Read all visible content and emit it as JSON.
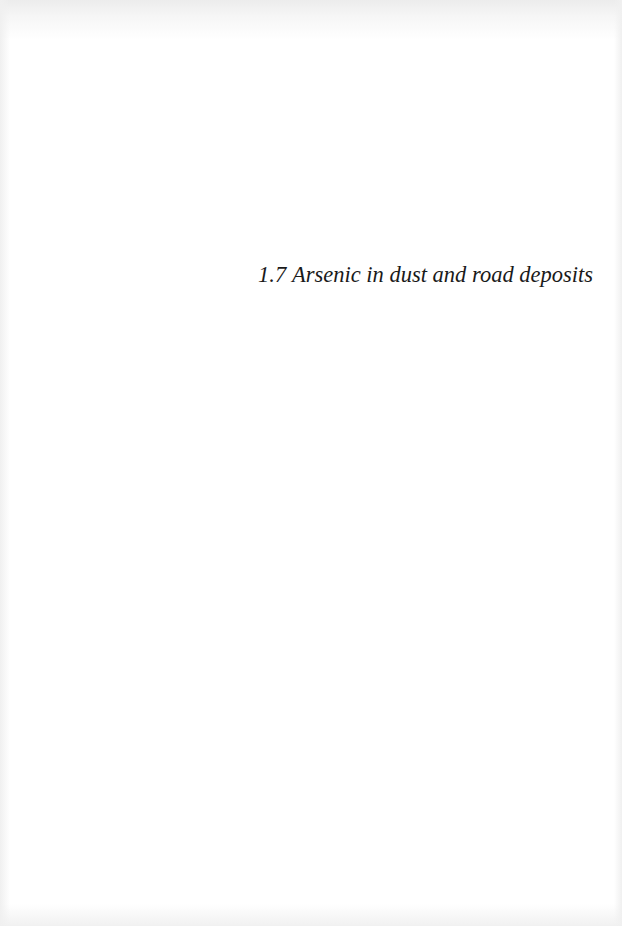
{
  "page": {
    "background": "#ffffff",
    "text_color": "#1a1a1a"
  },
  "heading": {
    "number": "1.7",
    "title": "Arsenic in dust and road deposits"
  }
}
